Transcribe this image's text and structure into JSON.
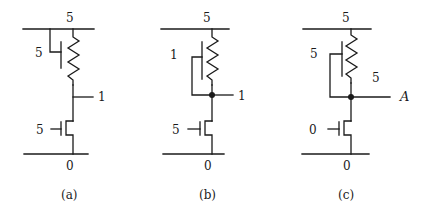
{
  "figure": {
    "panels": [
      {
        "id": "a",
        "caption": "(a)",
        "supply_label": "5",
        "ground_label": "0",
        "pullup_gate_label": "5",
        "output_label": "1",
        "pulldown_gate_label": "5",
        "pullup_gate_connection": "supply"
      },
      {
        "id": "b",
        "caption": "(b)",
        "supply_label": "5",
        "ground_label": "0",
        "pullup_gate_label": "1",
        "output_label": "1",
        "pulldown_gate_label": "5",
        "pullup_gate_connection": "output-node"
      },
      {
        "id": "c",
        "caption": "(c)",
        "supply_label": "5",
        "ground_label": "0",
        "pullup_gate_label": "5",
        "output_label": "A",
        "output_value_label": "5",
        "pulldown_gate_label": "0",
        "pullup_gate_connection": "output-node"
      }
    ]
  }
}
